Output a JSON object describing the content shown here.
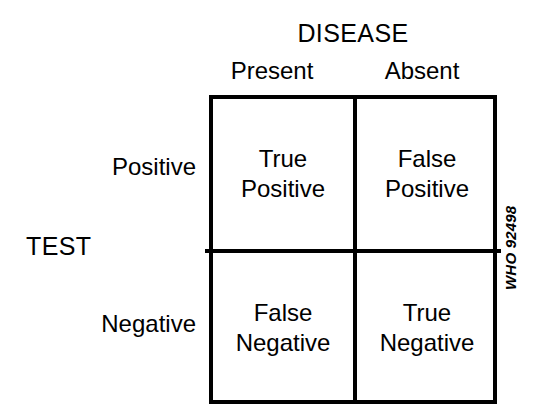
{
  "figure": {
    "kind": "two-by-two-contingency-table",
    "column_group_title": "DISEASE",
    "row_group_title": "TEST",
    "column_headers": [
      "Present",
      "Absent"
    ],
    "row_headers": [
      "Positive",
      "Negative"
    ],
    "cells": [
      [
        "True\nPositive",
        "False\nPositive"
      ],
      [
        "False\nNegative",
        "True\nNegative"
      ]
    ],
    "cell_labels_flat": {
      "r0c0": "True\nPositive",
      "r0c1": "False\nPositive",
      "r1c0": "False\nNegative",
      "r1c1": "True\nNegative"
    },
    "credit": "WHO 92498",
    "colors": {
      "background": "#ffffff",
      "ink": "#000000",
      "grid_line": "#000000"
    }
  }
}
